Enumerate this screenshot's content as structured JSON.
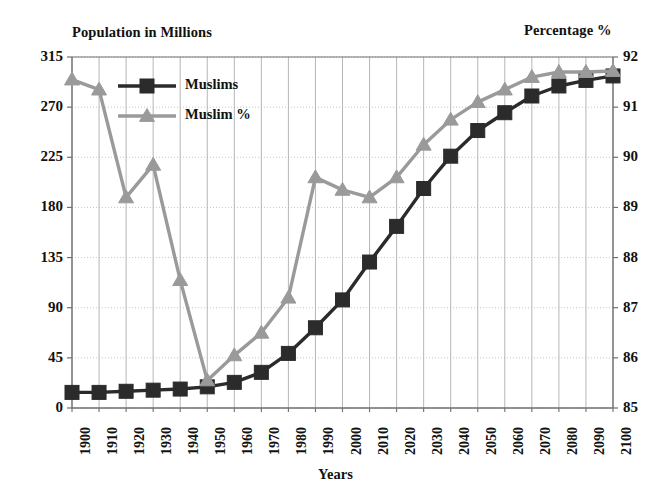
{
  "chart_data": {
    "type": "line",
    "title": "",
    "xlabel": "Years",
    "ylabel": "Population in Millions",
    "y2label": "Percentage %",
    "grid": true,
    "legend_position": "top-left-inside",
    "categories": [
      "1900",
      "1910",
      "1920",
      "1930",
      "1940",
      "1950",
      "1960",
      "1970",
      "1980",
      "1990",
      "2000",
      "2010",
      "2020",
      "2030",
      "2040",
      "2050",
      "2060",
      "2070",
      "2080",
      "2090",
      "2100"
    ],
    "ylim": [
      0,
      315
    ],
    "yticks": [
      "0",
      "45",
      "90",
      "135",
      "180",
      "225",
      "270",
      "315"
    ],
    "y2lim": [
      85,
      92
    ],
    "y2ticks": [
      "85",
      "86",
      "87",
      "88",
      "89",
      "90",
      "91",
      "92"
    ],
    "series": [
      {
        "name": "Muslims",
        "axis": "left",
        "color": "#2b2b2b",
        "marker": "square",
        "values": [
          14,
          14,
          15,
          16,
          17,
          19,
          23,
          32,
          49,
          72,
          97,
          131,
          163,
          197,
          226,
          249,
          265,
          280,
          289,
          294,
          298
        ]
      },
      {
        "name": "Muslim %",
        "axis": "right",
        "color": "#9a9a9a",
        "marker": "triangle",
        "values": [
          91.55,
          91.35,
          89.2,
          89.85,
          87.55,
          85.55,
          86.05,
          86.5,
          87.2,
          89.6,
          89.35,
          89.2,
          89.6,
          90.25,
          90.75,
          91.1,
          91.35,
          91.6,
          91.7,
          91.7,
          91.72
        ]
      }
    ]
  },
  "legend": {
    "items": [
      {
        "label": "Muslims",
        "color": "#2b2b2b",
        "marker": "square"
      },
      {
        "label": "Muslim %",
        "color": "#9a9a9a",
        "marker": "triangle"
      }
    ]
  },
  "colors": {
    "series_muslims": "#2b2b2b",
    "series_muslim_pct": "#9a9a9a",
    "grid": "#aeaeae",
    "axis": "#6f6f6f",
    "text": "#111111",
    "background": "#ffffff"
  }
}
